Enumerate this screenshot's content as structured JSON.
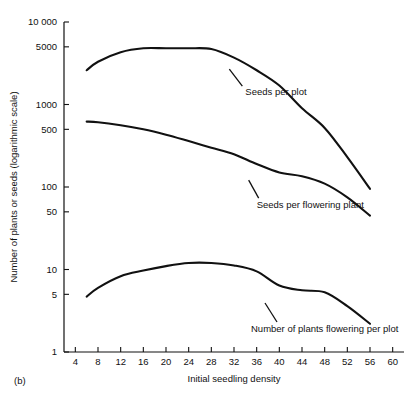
{
  "figure": {
    "panel_label": "(b)",
    "background": "#ffffff",
    "ink_color": "#111111"
  },
  "chart_data": {
    "type": "line",
    "title": "",
    "xlabel": "Initial seedling density",
    "ylabel": "Number of plants or seeds (logarithmic scale)",
    "yscale": "log",
    "ylim": [
      1,
      10000
    ],
    "xlim": [
      2,
      62
    ],
    "grid": false,
    "legend_position": "inline-annotations",
    "ytick_labels": [
      "10 000",
      "5000",
      "1000",
      "500",
      "100",
      "50",
      "10",
      "5",
      "1"
    ],
    "yticks": [
      10000,
      5000,
      1000,
      500,
      100,
      50,
      10,
      5,
      1
    ],
    "xticks": [
      4,
      8,
      12,
      16,
      20,
      24,
      28,
      32,
      36,
      40,
      44,
      48,
      52,
      56,
      60
    ],
    "xtick_labels": [
      "4",
      "8",
      "12",
      "16",
      "20",
      "24",
      "28",
      "32",
      "36",
      "40",
      "44",
      "48",
      "52",
      "56",
      "60"
    ],
    "series": [
      {
        "name": "Seeds per plot",
        "label": "Seeds per plot",
        "x": [
          6,
          8,
          12,
          16,
          20,
          24,
          28,
          32,
          36,
          40,
          44,
          48,
          52,
          56
        ],
        "values": [
          2600,
          3300,
          4300,
          4800,
          4800,
          4800,
          4700,
          3700,
          2600,
          1700,
          900,
          520,
          230,
          95
        ]
      },
      {
        "name": "Seeds per flowering plant",
        "label": "Seeds per flowering plant",
        "x": [
          6,
          8,
          12,
          16,
          20,
          24,
          28,
          32,
          36,
          40,
          44,
          48,
          52,
          56
        ],
        "values": [
          620,
          610,
          560,
          500,
          430,
          360,
          300,
          250,
          190,
          150,
          135,
          110,
          75,
          45
        ]
      },
      {
        "name": "Number of plants flowering per plot",
        "label": "Number of plants flowering per plot",
        "x": [
          6,
          8,
          12,
          16,
          20,
          24,
          28,
          32,
          36,
          40,
          44,
          48,
          52,
          56
        ],
        "values": [
          4.7,
          6.0,
          8.3,
          9.7,
          11.0,
          12.0,
          12.0,
          11.2,
          9.5,
          6.4,
          5.6,
          5.3,
          3.6,
          2.2
        ]
      }
    ],
    "annotations": [
      {
        "text": "Seeds per plot",
        "x": 34,
        "y": 1450
      },
      {
        "text": "Seeds per flowering plant",
        "x": 36,
        "y": 62
      },
      {
        "text": "Number of plants flowering per plot",
        "x": 35,
        "y": 1.9
      }
    ]
  }
}
